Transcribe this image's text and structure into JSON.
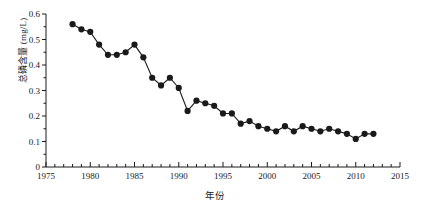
{
  "chart_data": {
    "type": "line",
    "title": "",
    "xlabel": "年份",
    "ylabel": "总磷含量 (mg/L)",
    "xlim": [
      1975,
      2015
    ],
    "ylim": [
      0,
      0.6
    ],
    "xticks": [
      1975,
      1980,
      1985,
      1990,
      1995,
      2000,
      2005,
      2010,
      2015
    ],
    "xtick_labels": [
      "1975",
      "1980",
      "1985",
      "1990",
      "1995",
      "2000",
      "2005",
      "2010",
      "2015"
    ],
    "yticks": [
      0,
      0.1,
      0.2,
      0.3,
      0.4,
      0.5,
      0.6
    ],
    "ytick_labels": [
      "0",
      "0.1",
      "0.2",
      "0.3",
      "0.4",
      "0.5",
      "0.6"
    ],
    "x_minor_tick_step": 1,
    "grid": false,
    "legend": null,
    "marker": "filled-circle",
    "marker_color": "#1a1a1a",
    "line_color": "#1a1a1a",
    "x": [
      1978,
      1979,
      1980,
      1981,
      1982,
      1983,
      1984,
      1985,
      1986,
      1987,
      1988,
      1989,
      1990,
      1991,
      1992,
      1993,
      1994,
      1995,
      1996,
      1997,
      1998,
      1999,
      2000,
      2001,
      2002,
      2003,
      2004,
      2005,
      2006,
      2007,
      2008,
      2009,
      2010,
      2011,
      2012
    ],
    "values": [
      0.56,
      0.54,
      0.53,
      0.48,
      0.44,
      0.44,
      0.45,
      0.48,
      0.43,
      0.35,
      0.32,
      0.35,
      0.31,
      0.22,
      0.26,
      0.25,
      0.24,
      0.21,
      0.21,
      0.17,
      0.18,
      0.16,
      0.15,
      0.14,
      0.16,
      0.14,
      0.16,
      0.15,
      0.14,
      0.15,
      0.14,
      0.13,
      0.11,
      0.13,
      0.13
    ],
    "series": [
      {
        "name": "总磷含量",
        "values": [
          0.56,
          0.54,
          0.53,
          0.48,
          0.44,
          0.44,
          0.45,
          0.48,
          0.43,
          0.35,
          0.32,
          0.35,
          0.31,
          0.22,
          0.26,
          0.25,
          0.24,
          0.21,
          0.21,
          0.17,
          0.18,
          0.16,
          0.15,
          0.14,
          0.16,
          0.14,
          0.16,
          0.15,
          0.14,
          0.15,
          0.14,
          0.13,
          0.11,
          0.13,
          0.13
        ]
      }
    ]
  }
}
